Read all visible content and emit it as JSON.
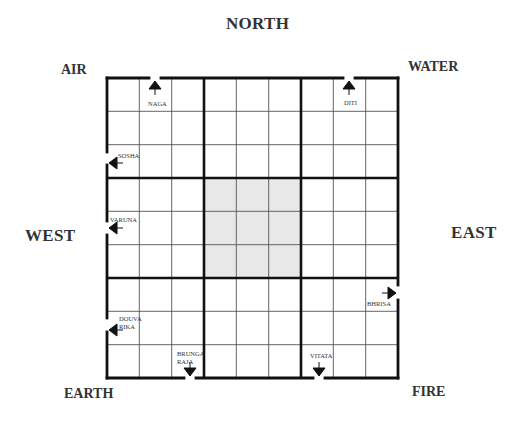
{
  "directions": {
    "north": "NORTH",
    "south": "",
    "west": "WEST",
    "east": "EAST"
  },
  "corners": {
    "top_left": "AIR",
    "top_right": "WATER",
    "bottom_left": "EARTH",
    "bottom_right": "FIRE"
  },
  "grid": {
    "rows": 9,
    "cols": 9,
    "center_shaded": true,
    "shade_color": "#e8e8e8",
    "line_color": "#1a1a1a"
  },
  "doors": [
    {
      "name": "NAGA",
      "side": "north",
      "arrow": "up"
    },
    {
      "name": "DITI",
      "side": "north",
      "arrow": "up"
    },
    {
      "name": "SOSHA",
      "side": "west",
      "arrow": "left"
    },
    {
      "name": "VARUNA",
      "side": "west",
      "arrow": "left"
    },
    {
      "name": "DOUVA RIKA",
      "line1": "DOUVA",
      "line2": "RIKA",
      "side": "west",
      "arrow": "left"
    },
    {
      "name": "BRUNGA RAJA",
      "line1": "BRUNGA",
      "line2": "RAJA",
      "side": "south",
      "arrow": "down"
    },
    {
      "name": "VITATA",
      "side": "south",
      "arrow": "down"
    },
    {
      "name": "BHRISA",
      "side": "east",
      "arrow": "right"
    }
  ]
}
